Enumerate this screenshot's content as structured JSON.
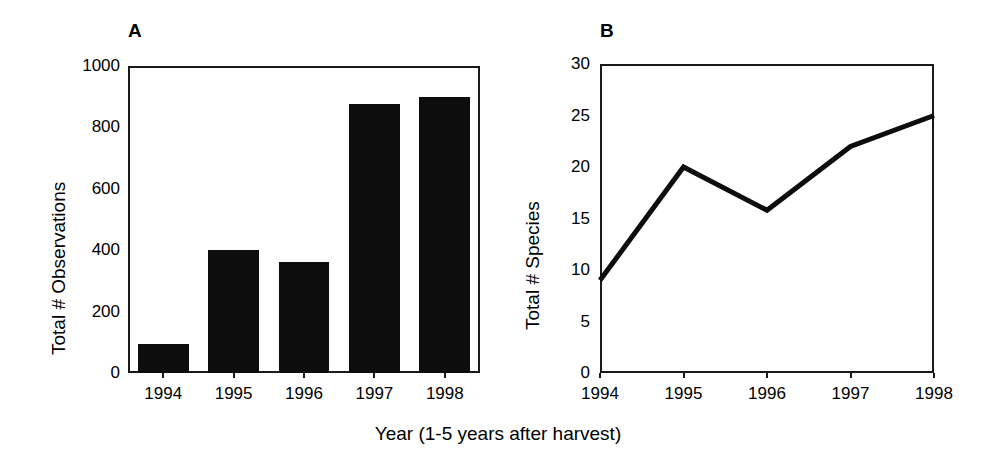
{
  "figure": {
    "xaxis_caption": "Year (1-5 years after harvest)",
    "ink_color": "#0d0d0d",
    "background_color": "#ffffff"
  },
  "panels": [
    {
      "letter": "A",
      "ylabel": "Total # Observations",
      "yticks": [
        "0",
        "200",
        "400",
        "600",
        "800",
        "1000"
      ],
      "xticks": [
        "1994",
        "1995",
        "1996",
        "1997",
        "1998"
      ]
    },
    {
      "letter": "B",
      "ylabel": "Total # Species",
      "yticks": [
        "0",
        "5",
        "10",
        "15",
        "20",
        "25",
        "30"
      ],
      "xticks": [
        "1994",
        "1995",
        "1996",
        "1997",
        "1998"
      ]
    }
  ],
  "chart_data": [
    {
      "type": "bar",
      "panel": "A",
      "title": "A",
      "categories": [
        "1994",
        "1995",
        "1996",
        "1997",
        "1998"
      ],
      "values": [
        95,
        400,
        360,
        875,
        900
      ],
      "xlabel": "Year (1-5 years after harvest)",
      "ylabel": "Total # Observations",
      "ylim": [
        0,
        1000
      ],
      "ytick_values": [
        0,
        200,
        400,
        600,
        800,
        1000
      ],
      "grid": false,
      "legend": false,
      "bar_color": "#0d0d0d"
    },
    {
      "type": "line",
      "panel": "B",
      "title": "B",
      "x": [
        "1994",
        "1995",
        "1996",
        "1997",
        "1998"
      ],
      "values": [
        9,
        20,
        15.8,
        22,
        25
      ],
      "xlabel": "Year (1-5 years after harvest)",
      "ylabel": "Total # Species",
      "ylim": [
        0,
        30
      ],
      "ytick_values": [
        0,
        5,
        10,
        15,
        20,
        25,
        30
      ],
      "grid": false,
      "legend": false,
      "line_color": "#0d0d0d",
      "line_width": 5
    }
  ]
}
